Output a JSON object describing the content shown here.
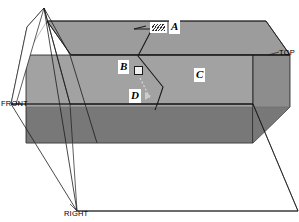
{
  "figure": {
    "type": "axonometric-projection-diagram",
    "background_color": "#ffffff",
    "line_color": "#1a1a1a",
    "faces": {
      "top_face_color": "#9c9c9c",
      "front_face_color": "#a0a0a0",
      "right_face_color": "#8a8a8a",
      "lower_band_color": "#787878",
      "glass_plane_color": "#b4b4b4"
    }
  },
  "callouts": [
    {
      "id": "A",
      "label": "A",
      "marker": "hatched-swatch",
      "marker_kind": "hatch"
    },
    {
      "id": "B",
      "label": "B",
      "marker": "open-square-swatch",
      "marker_kind": "open"
    },
    {
      "id": "C",
      "label": "C",
      "marker": "none",
      "marker_kind": "none"
    },
    {
      "id": "D",
      "label": "D",
      "marker": "arrow-swatch",
      "marker_kind": "arrow"
    }
  ],
  "view_labels": [
    {
      "id": "top",
      "label": "TOP"
    },
    {
      "id": "front",
      "label": "FRONT"
    },
    {
      "id": "right",
      "label": "RIGHT"
    }
  ],
  "labels": {
    "a": "A",
    "b": "B",
    "c": "C",
    "d": "D",
    "top": "TOP",
    "front": "FRONT",
    "right": "RIGHT"
  }
}
